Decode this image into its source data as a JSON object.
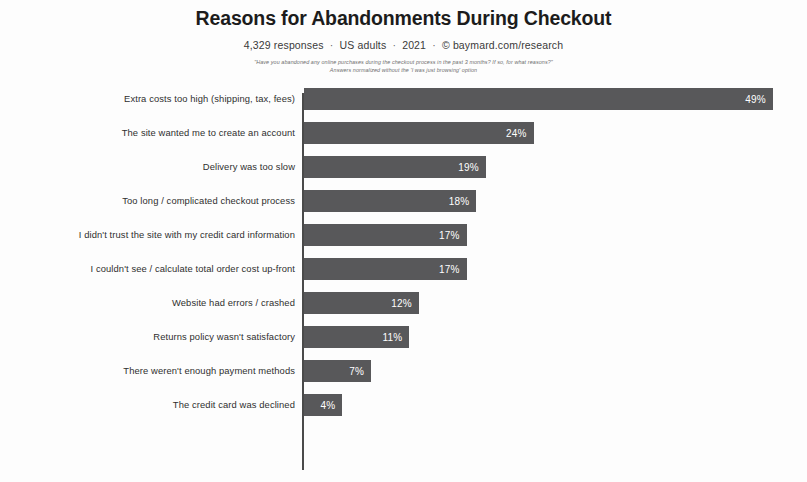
{
  "header": {
    "title": "Reasons for Abandonments During Checkout",
    "subtitle_parts": [
      "4,329 responses",
      "US adults",
      "2021",
      "© baymard.com/research"
    ],
    "separator": "·",
    "caption_line_1": "\"Have you abandoned any online purchases during the checkout process in the past 3 months? If so, for what reasons?\"",
    "caption_line_2": "Answers normalized without the 'I was just browsing' option"
  },
  "chart_data": {
    "type": "bar",
    "orientation": "horizontal",
    "title": "Reasons for Abandonments During Checkout",
    "xlabel": "",
    "ylabel": "",
    "xlim": [
      0,
      52
    ],
    "grid": false,
    "legend": false,
    "value_suffix": "%",
    "bar_color": "#58585a",
    "value_label_color": "#ffffff",
    "categories": [
      "Extra costs too high (shipping, tax, fees)",
      "The site wanted me to create an account",
      "Delivery was too slow",
      "Too long / complicated checkout process",
      "I didn't trust the site with my credit card information",
      "I couldn't see / calculate total order cost up-front",
      "Website had errors / crashed",
      "Returns policy wasn't satisfactory",
      "There weren't enough payment methods",
      "The credit card was declined"
    ],
    "values": [
      49,
      24,
      19,
      18,
      17,
      17,
      12,
      11,
      7,
      4
    ],
    "value_labels": [
      "49%",
      "24%",
      "19%",
      "18%",
      "17%",
      "17%",
      "12%",
      "11%",
      "7%",
      "4%"
    ]
  }
}
